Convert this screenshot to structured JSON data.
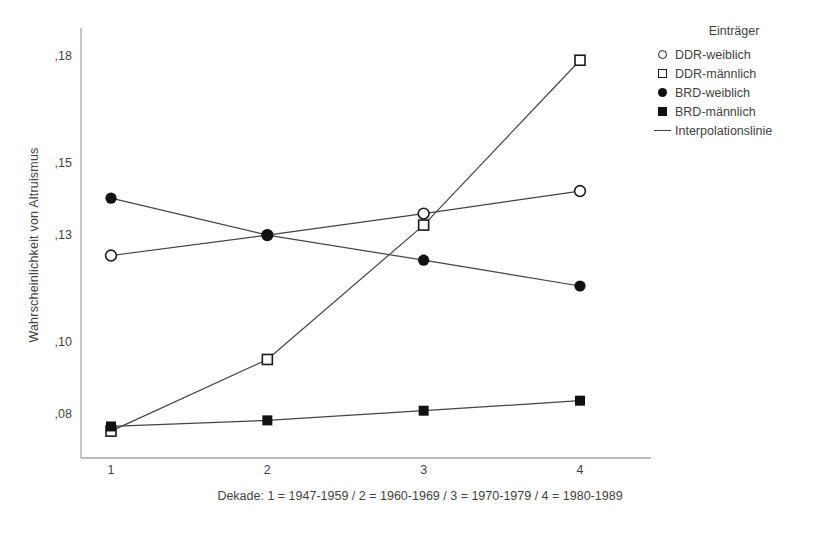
{
  "chart_data": {
    "type": "line",
    "title": "",
    "xlabel": "Dekade: 1 = 1947-1959 / 2 = 1960-1969 / 3 = 1970-1979 / 4 = 1980-1989",
    "ylabel": "Wahrscheinlichkeit von Altruismus",
    "categories": [
      "1",
      "2",
      "3",
      "4"
    ],
    "x": [
      1,
      2,
      3,
      4
    ],
    "xlim": [
      0.8,
      4.2
    ],
    "ylim": [
      0.068,
      0.188
    ],
    "grid": false,
    "legend_position": "right",
    "y_ticks": [
      0.08,
      0.1,
      0.13,
      0.15,
      0.18
    ],
    "y_tick_labels": [
      ",08",
      ",10",
      ",13",
      ",15",
      ",18"
    ],
    "x_tick_labels": [
      "1",
      "2",
      "3",
      "4"
    ],
    "series": [
      {
        "name": "DDR-weiblich",
        "marker": "open-circle",
        "values": [
          0.1245,
          0.1302,
          0.1362,
          0.1425
        ]
      },
      {
        "name": "DDR-männlich",
        "marker": "open-square",
        "values": [
          0.0755,
          0.0955,
          0.133,
          0.179
        ]
      },
      {
        "name": "BRD-weiblich",
        "marker": "filled-circle",
        "values": [
          0.1405,
          0.1302,
          0.1232,
          0.116
        ]
      },
      {
        "name": "BRD-männlich",
        "marker": "filled-square",
        "values": [
          0.0768,
          0.0785,
          0.0812,
          0.084
        ]
      }
    ]
  },
  "legend": {
    "title": "Einträger",
    "items": [
      {
        "label": "DDR-weiblich",
        "marker": "open-circle-icon"
      },
      {
        "label": "DDR-männlich",
        "marker": "open-square-icon"
      },
      {
        "label": "BRD-weiblich",
        "marker": "filled-circle-icon"
      },
      {
        "label": "BRD-männlich",
        "marker": "filled-square-icon"
      },
      {
        "label": "Interpolationslinie",
        "marker": "line-icon"
      }
    ]
  },
  "colors": {
    "line": "#444444",
    "marker_stroke": "#1a1a1a",
    "marker_fill": "#111111",
    "axis": "#9a9a9a",
    "text": "#3f3f3f",
    "background": "#ffffff"
  }
}
